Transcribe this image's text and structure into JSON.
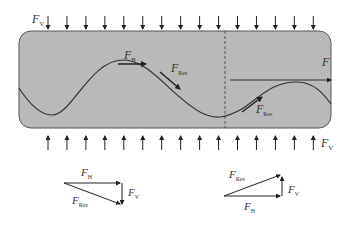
{
  "diagram": {
    "type": "force-diagram",
    "channel": {
      "fill": "#b9b9b9",
      "stroke": "#555555",
      "divider": "dashed-vertical"
    },
    "labels": {
      "fv_top": {
        "main": "F",
        "sub": "V"
      },
      "fv_bottom": {
        "main": "F",
        "sub": "V"
      },
      "fh_left": {
        "main": "F",
        "sub": "H"
      },
      "fres_left": {
        "main": "F",
        "sub": "Res"
      },
      "f_right": {
        "main": "F",
        "sub": ""
      },
      "fres_right": {
        "main": "F",
        "sub": "Res"
      }
    },
    "top_arrows_count": 15,
    "bottom_arrows_count": 15,
    "vector_triangle_left": {
      "fh": {
        "main": "F",
        "sub": "H"
      },
      "fv": {
        "main": "F",
        "sub": "V"
      },
      "fres": {
        "main": "F",
        "sub": "Res"
      }
    },
    "vector_triangle_right": {
      "fres": {
        "main": "F",
        "sub": "Res"
      },
      "fv": {
        "main": "F",
        "sub": "V"
      },
      "fh": {
        "main": "F",
        "sub": "H"
      }
    }
  }
}
